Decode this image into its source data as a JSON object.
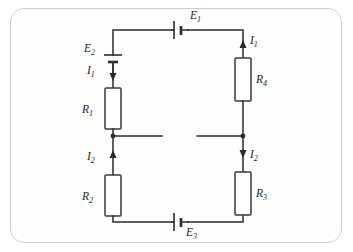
{
  "diagram": {
    "frame": {
      "style": "rounded-rectangle",
      "border_color": "#cfcfcf"
    },
    "wire_color": "#2b2b2b",
    "background_color": "#ffffff",
    "components": {
      "batteries": [
        {
          "id": "E1",
          "label": "E",
          "subscript": "1",
          "orientation": "horizontal",
          "position": "top-branch"
        },
        {
          "id": "E2",
          "label": "E",
          "subscript": "2",
          "orientation": "vertical",
          "position": "left-branch-upper"
        },
        {
          "id": "E3",
          "label": "E",
          "subscript": "3",
          "orientation": "horizontal",
          "position": "bottom-branch"
        }
      ],
      "resistors": [
        {
          "id": "R1",
          "label": "R",
          "subscript": "1",
          "orientation": "vertical",
          "position": "left-branch-upper"
        },
        {
          "id": "R2",
          "label": "R",
          "subscript": "2",
          "orientation": "vertical",
          "position": "left-branch-lower"
        },
        {
          "id": "R3",
          "label": "R",
          "subscript": "3",
          "orientation": "vertical",
          "position": "right-branch-lower"
        },
        {
          "id": "R4",
          "label": "R",
          "subscript": "4",
          "orientation": "vertical",
          "position": "right-branch-upper"
        }
      ],
      "currents": [
        {
          "id": "I1-left",
          "label": "I",
          "subscript": "1",
          "direction": "down",
          "branch": "left-upper"
        },
        {
          "id": "I1-right",
          "label": "I",
          "subscript": "1",
          "direction": "up",
          "branch": "right-upper"
        },
        {
          "id": "I2-left",
          "label": "I",
          "subscript": "2",
          "direction": "up",
          "branch": "left-lower"
        },
        {
          "id": "I2-right",
          "label": "I",
          "subscript": "2",
          "direction": "down",
          "branch": "right-lower"
        }
      ],
      "nodes": [
        {
          "id": "node-left",
          "position": "left-branch-middle"
        },
        {
          "id": "node-right",
          "position": "right-branch-middle"
        }
      ]
    }
  },
  "labels": {
    "E1": {
      "base": "E",
      "sub": "1"
    },
    "E2": {
      "base": "E",
      "sub": "2"
    },
    "E3": {
      "base": "E",
      "sub": "3"
    },
    "R1": {
      "base": "R",
      "sub": "1"
    },
    "R2": {
      "base": "R",
      "sub": "2"
    },
    "R3": {
      "base": "R",
      "sub": "3"
    },
    "R4": {
      "base": "R",
      "sub": "4"
    },
    "I1a": {
      "base": "I",
      "sub": "1"
    },
    "I1b": {
      "base": "I",
      "sub": "1"
    },
    "I2a": {
      "base": "I",
      "sub": "2"
    },
    "I2b": {
      "base": "I",
      "sub": "2"
    }
  }
}
